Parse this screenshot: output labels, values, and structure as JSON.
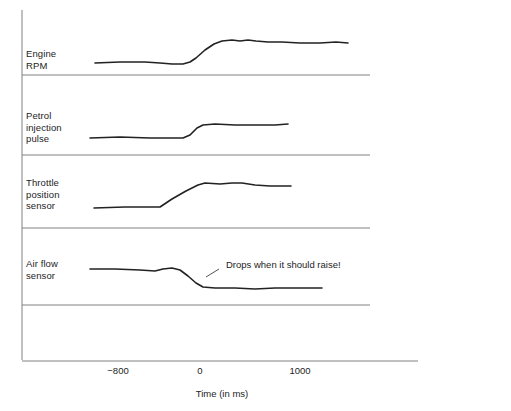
{
  "figure": {
    "background_color": "#ffffff",
    "line_color": "#222222",
    "axis_color": "#808080",
    "text_color": "#1d1d1d"
  },
  "axis": {
    "x_title": "Time (in ms)",
    "ticks": [
      {
        "label": "−800",
        "value": -800,
        "x": 118
      },
      {
        "label": "0",
        "value": 0,
        "x": 200
      },
      {
        "label": "1000",
        "value": 1000,
        "x": 300
      }
    ],
    "x_range": [
      -1100,
      2200
    ],
    "grid": false
  },
  "annotation": {
    "text": "Drops when it should raise!",
    "target_channel": "Air flow sensor"
  },
  "channels": [
    {
      "id": "engine-rpm",
      "label": "Engine\nRPM",
      "label_x": 26,
      "label_y": 54
    },
    {
      "id": "petrol-injection-pulse",
      "label": "Petrol\ninjection\npulse",
      "label_x": 26,
      "label_y": 116
    },
    {
      "id": "throttle-position-sensor",
      "label": "Throttle\nposition\nsensor",
      "label_x": 26,
      "label_y": 183
    },
    {
      "id": "air-flow-sensor",
      "label": "Air flow\nsensor",
      "label_x": 26,
      "label_y": 263
    }
  ],
  "chart_data": {
    "type": "line",
    "title": "",
    "xlabel": "Time (in ms)",
    "ylabel": "",
    "xlim": [
      -1100,
      2200
    ],
    "grid": false,
    "legend": "none",
    "annotations": [
      {
        "text": "Drops when it should raise!",
        "x_ms": 300,
        "series": "Air flow sensor"
      }
    ],
    "series": [
      {
        "name": "Engine RPM",
        "description": "Low idle level, slight dip, then rises sharply after 0 ms to a high plateau with small overshoot, staying high.",
        "points_px": [
          [
            95,
            63
          ],
          [
            120,
            62
          ],
          [
            145,
            62
          ],
          [
            160,
            63
          ],
          [
            172,
            64
          ],
          [
            183,
            64
          ],
          [
            190,
            62
          ],
          [
            196,
            58
          ],
          [
            205,
            50
          ],
          [
            214,
            44
          ],
          [
            222,
            41
          ],
          [
            232,
            40
          ],
          [
            240,
            41
          ],
          [
            248,
            40
          ],
          [
            256,
            41
          ],
          [
            268,
            42
          ],
          [
            282,
            42
          ],
          [
            300,
            43
          ],
          [
            320,
            43
          ],
          [
            336,
            42
          ],
          [
            348,
            43
          ]
        ]
      },
      {
        "name": "Petrol injection pulse",
        "description": "Flat low injection level, steps up sharply just before 0 ms to a higher constant pulse width.",
        "points_px": [
          [
            90,
            138
          ],
          [
            120,
            137
          ],
          [
            150,
            138
          ],
          [
            172,
            138
          ],
          [
            183,
            138
          ],
          [
            190,
            135
          ],
          [
            197,
            128
          ],
          [
            203,
            125
          ],
          [
            215,
            124
          ],
          [
            235,
            125
          ],
          [
            255,
            125
          ],
          [
            275,
            125
          ],
          [
            288,
            124
          ]
        ]
      },
      {
        "name": "Throttle position sensor",
        "description": "Closed throttle baseline, ramps open from about -400 ms to 0 ms, peaks and holds slightly open.",
        "points_px": [
          [
            94,
            208
          ],
          [
            125,
            207
          ],
          [
            150,
            207
          ],
          [
            160,
            207
          ],
          [
            172,
            199
          ],
          [
            186,
            191
          ],
          [
            198,
            185
          ],
          [
            205,
            183
          ],
          [
            220,
            184
          ],
          [
            232,
            183
          ],
          [
            242,
            183
          ],
          [
            255,
            185
          ],
          [
            270,
            186
          ],
          [
            281,
            186
          ],
          [
            291,
            186
          ]
        ]
      },
      {
        "name": "Air flow sensor",
        "description": "Steady air flow, small bump, then incorrectly DROPS to a lower level after throttle opening instead of rising.",
        "points_px": [
          [
            90,
            269
          ],
          [
            115,
            269
          ],
          [
            140,
            270
          ],
          [
            155,
            271
          ],
          [
            163,
            269
          ],
          [
            172,
            268
          ],
          [
            180,
            270
          ],
          [
            188,
            276
          ],
          [
            196,
            283
          ],
          [
            203,
            287
          ],
          [
            215,
            288
          ],
          [
            235,
            288
          ],
          [
            255,
            289
          ],
          [
            275,
            288
          ],
          [
            300,
            288
          ],
          [
            315,
            288
          ],
          [
            322,
            288
          ]
        ]
      }
    ]
  },
  "separators": [
    {
      "id": "sep-1",
      "y": 75,
      "x1": 22,
      "x2": 370
    },
    {
      "id": "sep-2",
      "y": 155,
      "x1": 22,
      "x2": 370
    },
    {
      "id": "sep-3",
      "y": 228,
      "x1": 22,
      "x2": 370
    },
    {
      "id": "sep-4",
      "y": 305,
      "x1": 22,
      "x2": 370
    }
  ]
}
